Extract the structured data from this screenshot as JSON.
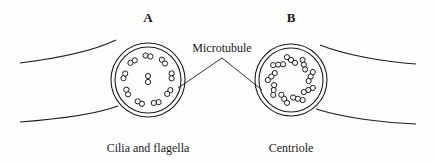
{
  "figure": {
    "background_color": "#fdfdfc",
    "ink_color": "#1c1c1c",
    "panel_a": {
      "key_label": "A",
      "caption": "Cilia and flagella",
      "center": {
        "x": 148,
        "y": 80
      },
      "outer_radius": 37,
      "inner_radius": 33,
      "tubule_radius": 2.6,
      "arrangement": "9+2",
      "doublet_count": 9,
      "doublet_ring_radius": 24,
      "central_pair_count": 2,
      "central_pair": [
        {
          "x": 148,
          "y": 76
        },
        {
          "x": 148,
          "y": 82
        }
      ],
      "doublets": [
        {
          "angle": -90,
          "tilt": 10
        },
        {
          "angle": -50,
          "tilt": 10
        },
        {
          "angle": -10,
          "tilt": 10
        },
        {
          "angle": 30,
          "tilt": 10
        },
        {
          "angle": 70,
          "tilt": 10
        },
        {
          "angle": 110,
          "tilt": 10
        },
        {
          "angle": 150,
          "tilt": 10
        },
        {
          "angle": 190,
          "tilt": 10
        },
        {
          "angle": 230,
          "tilt": 10
        }
      ]
    },
    "panel_b": {
      "key_label": "B",
      "caption": "Centriole",
      "center": {
        "x": 291,
        "y": 80
      },
      "outer_radius": 36,
      "inner_radius": 32,
      "tubule_radius": 2.6,
      "arrangement": "9 triplets",
      "triplet_count": 9,
      "triplet_ring_radius": 20,
      "central_pair_count": 0,
      "triplets": [
        {
          "angle": -90,
          "tilt": 35
        },
        {
          "angle": -50,
          "tilt": 35
        },
        {
          "angle": -10,
          "tilt": 35
        },
        {
          "angle": 30,
          "tilt": 35
        },
        {
          "angle": 70,
          "tilt": 35
        },
        {
          "angle": 110,
          "tilt": 35
        },
        {
          "angle": 150,
          "tilt": 35
        },
        {
          "angle": 190,
          "tilt": 35
        },
        {
          "angle": 230,
          "tilt": 35
        }
      ]
    },
    "callout": {
      "label": "Microtubule",
      "text_x": 222,
      "text_y": 52,
      "apex": {
        "x": 222,
        "y": 58
      },
      "left_target": {
        "x": 178,
        "y": 88
      },
      "right_target": {
        "x": 262,
        "y": 90
      }
    },
    "membranes": [
      {
        "name": "membrane-upper-left",
        "d": "M 20 63 C 60 58 95 50 116 40"
      },
      {
        "name": "membrane-lower-left",
        "d": "M 20 122 C 60 119 96 114 118 106"
      },
      {
        "name": "membrane-upper-right",
        "d": "M 320 45 C 345 55 385 62 416 64"
      },
      {
        "name": "membrane-lower-right",
        "d": "M 316 109 C 345 118 385 123 416 124"
      }
    ],
    "key_label_y": 22,
    "caption_y": 152
  }
}
